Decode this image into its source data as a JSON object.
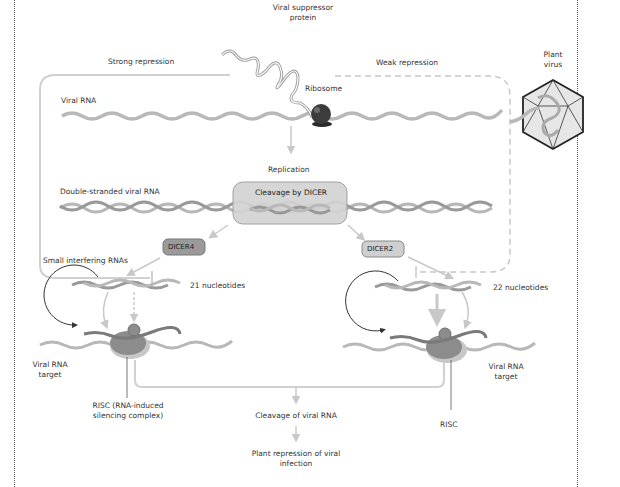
{
  "labels": {
    "viral_suppressor_protein": [
      "Viral suppressor",
      "protein"
    ],
    "strong_repression": "Strong repression",
    "weak_repression": "Weak repression",
    "plant_virus": [
      "Plant",
      "virus"
    ],
    "ribosome": "Ribosome",
    "viral_rna": "Viral RNA",
    "replication": "Replication",
    "double_stranded_viral_rna": "Double-stranded viral RNA",
    "cleavage_by_dicer": "Cleavage by DICER",
    "dicer4": "DICER4",
    "dicer2": "DICER2",
    "small_interfering_rnas": "Small interfering RNAs",
    "nt21": "21 nucleotides",
    "nt22": "22 nucleotides",
    "viral_rna_target_left": [
      "Viral RNA",
      "target"
    ],
    "viral_rna_target_right": [
      "Viral RNA",
      "target"
    ],
    "risc_left": [
      "RISC (RNA-induced",
      "silencing complex)"
    ],
    "risc_right": "RISC",
    "cleavage_of_viral_rna": "Cleavage of viral RNA",
    "plant_repression": [
      "Plant repression of viral",
      "infection"
    ]
  },
  "colors": {
    "rna_strand": "#b5b5b5",
    "rna_dark": "#8a8a8a",
    "cleavage_box_fill": "#d3d3d3",
    "dicer4_fill": "#9a9a9a",
    "dicer2_fill": "#cfcfcf",
    "ribosome": "#3c3c3c",
    "risc": "#8c8c8c",
    "arrow": "#c8c8c8"
  }
}
